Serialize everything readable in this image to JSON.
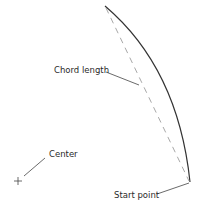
{
  "diagram": {
    "type": "arc-chord",
    "labels": {
      "chord": "Chord length",
      "center": "Center",
      "start": "Start point"
    },
    "colors": {
      "arc": "#333333",
      "chord": "#a8a8a8",
      "leader": "#444444",
      "text": "#2a2a2a",
      "background": "#ffffff"
    }
  }
}
